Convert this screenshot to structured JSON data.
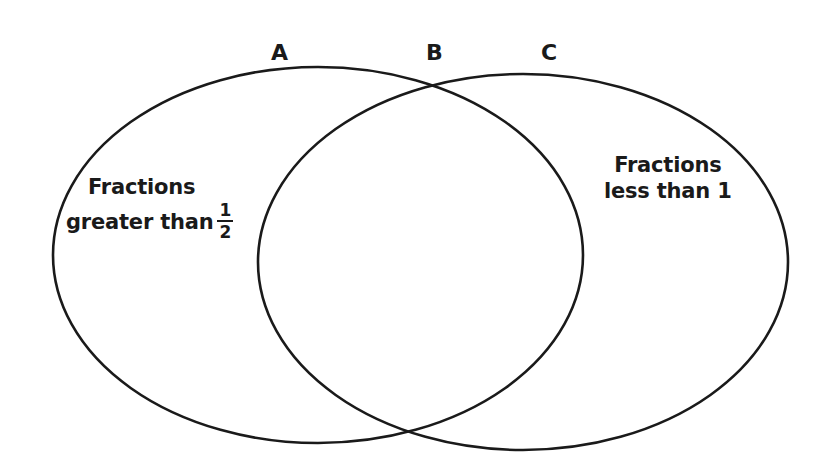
{
  "diagram": {
    "type": "venn",
    "region_labels": {
      "a": "A",
      "b": "B",
      "c": "C"
    },
    "left_set": {
      "line1": "Fractions",
      "line2": "greater than",
      "fraction": {
        "numerator": "1",
        "denominator": "2"
      }
    },
    "right_set": {
      "line1": "Fractions",
      "line2": "less than 1"
    },
    "colors": {
      "stroke": "#1a1a1a",
      "background": "#ffffff",
      "text": "#1a1a1a"
    }
  }
}
